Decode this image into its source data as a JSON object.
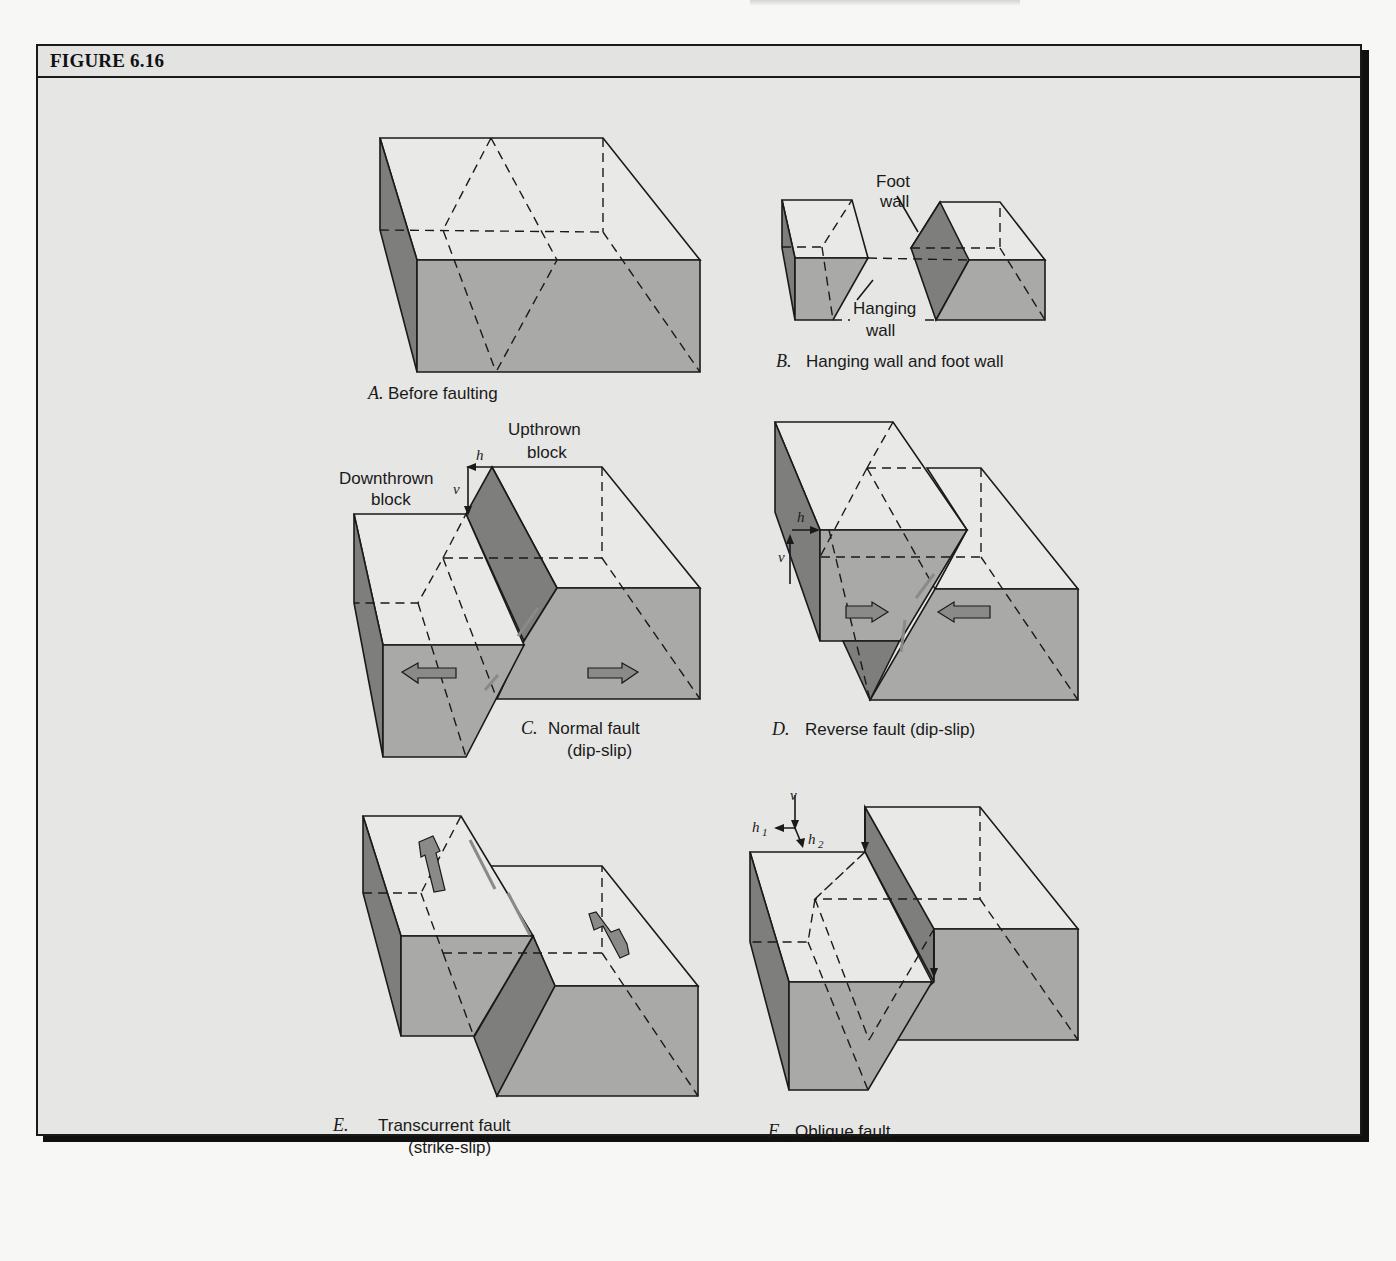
{
  "figure": {
    "title": "FIGURE 6.16",
    "panels": [
      {
        "id": "A",
        "letter": "A.",
        "caption": "Before faulting"
      },
      {
        "id": "B",
        "letter": "B.",
        "caption": "Hanging wall and foot wall",
        "labels": {
          "foot_wall_1": "Foot",
          "foot_wall_2": "wall",
          "hanging_wall_1": "Hanging",
          "hanging_wall_2": "wall"
        }
      },
      {
        "id": "C",
        "letter": "C.",
        "caption_1": "Normal fault",
        "caption_2": "(dip-slip)",
        "labels": {
          "upthrown_1": "Upthrown",
          "upthrown_2": "block",
          "downthrown_1": "Downthrown",
          "downthrown_2": "block",
          "h": "h",
          "v": "v"
        }
      },
      {
        "id": "D",
        "letter": "D.",
        "caption": "Reverse fault (dip-slip)",
        "labels": {
          "h": "h",
          "v": "v"
        }
      },
      {
        "id": "E",
        "letter": "E.",
        "caption_1": "Transcurrent fault",
        "caption_2": "(strike-slip)"
      },
      {
        "id": "F",
        "letter": "F.",
        "caption": "Oblique fault",
        "labels": {
          "v": "v",
          "h1": "h",
          "h1_sub": "1",
          "h2": "h",
          "h2_sub": "2"
        }
      }
    ]
  },
  "colors": {
    "background": "#e6e6e4",
    "top_face": "#e9e9e7",
    "front_face": "#a9a9a7",
    "side_face": "#7e7e7c",
    "frame": "#1a1a1a"
  }
}
